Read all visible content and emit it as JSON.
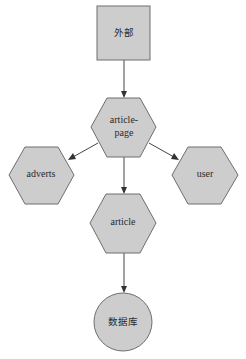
{
  "diagram": {
    "type": "dependency-graph",
    "nodes": [
      {
        "id": "external",
        "label": "外部",
        "shape": "square"
      },
      {
        "id": "article-page",
        "label_lines": [
          "article-",
          "page"
        ],
        "shape": "hexagon"
      },
      {
        "id": "adverts",
        "label": "adverts",
        "shape": "hexagon"
      },
      {
        "id": "user",
        "label": "user",
        "shape": "hexagon"
      },
      {
        "id": "article",
        "label": "article",
        "shape": "hexagon"
      },
      {
        "id": "database",
        "label": "数据库",
        "shape": "circle"
      }
    ],
    "edges": [
      {
        "from": "external",
        "to": "article-page"
      },
      {
        "from": "article-page",
        "to": "adverts"
      },
      {
        "from": "article-page",
        "to": "user"
      },
      {
        "from": "article-page",
        "to": "article"
      },
      {
        "from": "article",
        "to": "database"
      }
    ],
    "colors": {
      "node_fill": "#cdcdcd",
      "node_stroke": "#6e6e6e",
      "edge": "#444444"
    }
  }
}
